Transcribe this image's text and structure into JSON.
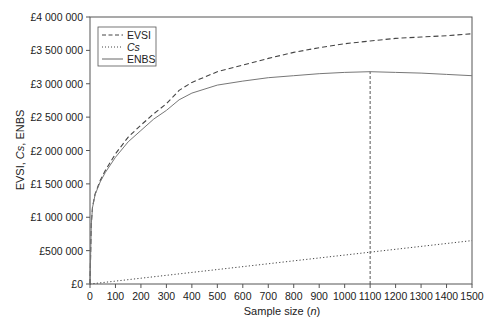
{
  "chart_data": {
    "type": "line",
    "title": "",
    "xlabel": "Sample size (n)",
    "xlabel_parts": [
      "Sample size (",
      "n",
      ")"
    ],
    "ylabel": "EVSI, Cs, ENBS",
    "ylabel_parts": [
      "EVSI, ",
      "Cs",
      ", ENBS"
    ],
    "xlim": [
      0,
      1500
    ],
    "ylim": [
      0,
      4000000
    ],
    "x_ticks": [
      0,
      100,
      200,
      300,
      400,
      500,
      600,
      700,
      800,
      900,
      1000,
      1100,
      1200,
      1300,
      1400,
      1500
    ],
    "y_ticks": [
      0,
      500000,
      1000000,
      1500000,
      2000000,
      2500000,
      3000000,
      3500000,
      4000000
    ],
    "y_tick_labels": [
      "£0",
      "£500 000",
      "£1 000 000",
      "£1 500 000",
      "£2 000 000",
      "£2 500 000",
      "£3 000 000",
      "£3 500 000",
      "£4 000 000"
    ],
    "grid": false,
    "legend_position": "upper left",
    "series": [
      {
        "name": "EVSI",
        "style": "dashed",
        "x": [
          0,
          5,
          10,
          20,
          40,
          60,
          100,
          150,
          200,
          250,
          300,
          350,
          400,
          500,
          600,
          700,
          800,
          900,
          1000,
          1100,
          1200,
          1300,
          1400,
          1500
        ],
        "values": [
          0,
          900000,
          1150000,
          1350000,
          1550000,
          1700000,
          1950000,
          2200000,
          2380000,
          2550000,
          2700000,
          2900000,
          3020000,
          3180000,
          3280000,
          3380000,
          3470000,
          3540000,
          3600000,
          3640000,
          3680000,
          3700000,
          3720000,
          3750000
        ]
      },
      {
        "name": "Cs",
        "style": "dotted",
        "italic": true,
        "x": [
          0,
          1500
        ],
        "values": [
          0,
          650000
        ]
      },
      {
        "name": "ENBS",
        "style": "solid",
        "x": [
          0,
          5,
          10,
          20,
          40,
          60,
          100,
          150,
          200,
          250,
          300,
          350,
          400,
          500,
          600,
          700,
          800,
          900,
          1000,
          1100,
          1200,
          1300,
          1400,
          1500
        ],
        "values": [
          0,
          900000,
          1145000,
          1340000,
          1530000,
          1670000,
          1900000,
          2130000,
          2300000,
          2470000,
          2600000,
          2760000,
          2860000,
          2980000,
          3040000,
          3090000,
          3120000,
          3150000,
          3170000,
          3180000,
          3170000,
          3160000,
          3140000,
          3120000
        ]
      }
    ],
    "annotations": [
      {
        "type": "vertical_line",
        "x": 1100,
        "style": "dashed",
        "from_y": 0,
        "to_y": 3180000,
        "note": "Optimal sample size (max ENBS)"
      }
    ]
  }
}
